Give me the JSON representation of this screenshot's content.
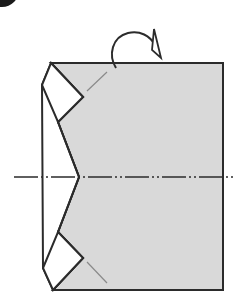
{
  "diagram": {
    "step_marker": "step-badge",
    "instruction": "mountain fold (turn over)",
    "colors": {
      "paper_back": "#d9d9d9",
      "paper_front": "#ffffff",
      "outline": "#2b2b2b",
      "crease": "#8a8a8a",
      "marker": "#1a1a1a"
    },
    "elements": [
      {
        "name": "step-badge",
        "shape": "circle"
      },
      {
        "name": "turn-over-arrow",
        "shape": "curved-arrow"
      },
      {
        "name": "paper-square",
        "shape": "rectangle"
      },
      {
        "name": "top-flap-triangle",
        "shape": "triangle"
      },
      {
        "name": "bottom-flap-triangle",
        "shape": "triangle"
      },
      {
        "name": "center-fold-line",
        "shape": "dash-dot-line"
      }
    ]
  }
}
